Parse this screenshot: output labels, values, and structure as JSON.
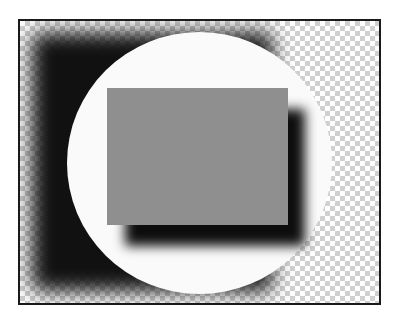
{
  "figure": {
    "colors": {
      "frame_border": "#1a1a1a",
      "checker_light": "#ffffff",
      "checker_dark": "#d0d0d0",
      "shadow": "#111111",
      "circle": "#fafafa",
      "rectangle": "#8f8f8f"
    }
  }
}
